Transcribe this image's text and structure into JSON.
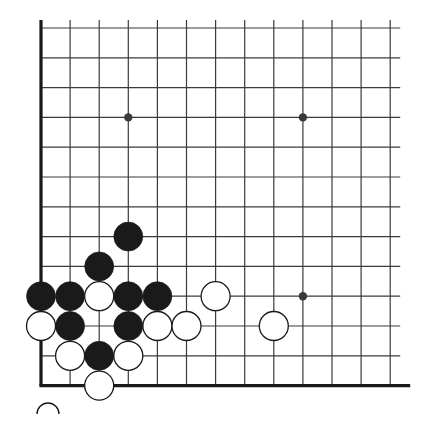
{
  "figure": {
    "kind": "go-board-diagram",
    "background_color": "#ffffff",
    "line_color": "#3a3a3a",
    "edge_line_color": "#1a1a1a",
    "black_stone_color": "#1a1a1a",
    "white_stone_color": "#ffffff",
    "white_stone_outline_color": "#1a1a1a"
  },
  "board": {
    "visible_columns": 13,
    "visible_rows": 13,
    "origin_x": 41,
    "origin_y": 28,
    "spacing_x": 29.1,
    "spacing_y": 29.8,
    "left_edge_is_board_border": true,
    "bottom_edge_is_board_border": true,
    "top_edge_is_board_border": false,
    "right_edge_is_board_border": false,
    "grid_line_width": 1.2,
    "border_line_width": 3.2,
    "stone_radius": 14.5,
    "star_point_radius": 4.2,
    "star_points": [
      {
        "col": 3,
        "row": 3
      },
      {
        "col": 9,
        "row": 3
      },
      {
        "col": 9,
        "row": 9
      }
    ],
    "stones": [
      {
        "col": 3,
        "row": 7,
        "color": "black"
      },
      {
        "col": 2,
        "row": 8,
        "color": "black"
      },
      {
        "col": 0,
        "row": 9,
        "color": "black"
      },
      {
        "col": 1,
        "row": 9,
        "color": "black"
      },
      {
        "col": 2,
        "row": 9,
        "color": "white"
      },
      {
        "col": 3,
        "row": 9,
        "color": "black"
      },
      {
        "col": 4,
        "row": 9,
        "color": "black"
      },
      {
        "col": 6,
        "row": 9,
        "color": "white"
      },
      {
        "col": 0,
        "row": 10,
        "color": "white"
      },
      {
        "col": 1,
        "row": 10,
        "color": "black"
      },
      {
        "col": 3,
        "row": 10,
        "color": "black"
      },
      {
        "col": 4,
        "row": 10,
        "color": "white"
      },
      {
        "col": 5,
        "row": 10,
        "color": "white"
      },
      {
        "col": 8,
        "row": 10,
        "color": "white"
      },
      {
        "col": 1,
        "row": 11,
        "color": "white"
      },
      {
        "col": 2,
        "row": 11,
        "color": "black"
      },
      {
        "col": 3,
        "row": 11,
        "color": "white"
      },
      {
        "col": 2,
        "row": 12,
        "color": "white"
      }
    ],
    "caption_mark": {
      "present": true,
      "shape": "circle-outline-partial",
      "x": 48,
      "y": 414,
      "radius": 11
    }
  }
}
